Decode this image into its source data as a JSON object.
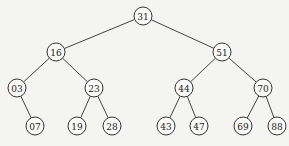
{
  "diagram": {
    "type": "binary-search-tree",
    "node_radius": 9,
    "colors": {
      "background": "#f4f4f2",
      "node_fill": "#fafaf8",
      "stroke": "#333333",
      "text": "#222222"
    },
    "nodes": [
      {
        "id": "n31",
        "label": "31",
        "x": 143,
        "y": 16
      },
      {
        "id": "n16",
        "label": "16",
        "x": 56,
        "y": 52
      },
      {
        "id": "n51",
        "label": "51",
        "x": 222,
        "y": 52
      },
      {
        "id": "n03",
        "label": "03",
        "x": 17,
        "y": 88
      },
      {
        "id": "n23",
        "label": "23",
        "x": 94,
        "y": 88
      },
      {
        "id": "n44",
        "label": "44",
        "x": 184,
        "y": 88
      },
      {
        "id": "n70",
        "label": "70",
        "x": 263,
        "y": 88
      },
      {
        "id": "n07",
        "label": "07",
        "x": 35,
        "y": 126
      },
      {
        "id": "n19",
        "label": "19",
        "x": 77,
        "y": 126
      },
      {
        "id": "n28",
        "label": "28",
        "x": 112,
        "y": 126
      },
      {
        "id": "n43",
        "label": "43",
        "x": 166,
        "y": 126
      },
      {
        "id": "n47",
        "label": "47",
        "x": 199,
        "y": 126
      },
      {
        "id": "n69",
        "label": "69",
        "x": 243,
        "y": 126
      },
      {
        "id": "n88",
        "label": "88",
        "x": 277,
        "y": 126
      }
    ],
    "edges": [
      [
        "n31",
        "n16"
      ],
      [
        "n31",
        "n51"
      ],
      [
        "n16",
        "n03"
      ],
      [
        "n16",
        "n23"
      ],
      [
        "n51",
        "n44"
      ],
      [
        "n51",
        "n70"
      ],
      [
        "n03",
        "n07"
      ],
      [
        "n23",
        "n19"
      ],
      [
        "n23",
        "n28"
      ],
      [
        "n44",
        "n43"
      ],
      [
        "n44",
        "n47"
      ],
      [
        "n70",
        "n69"
      ],
      [
        "n70",
        "n88"
      ]
    ]
  }
}
